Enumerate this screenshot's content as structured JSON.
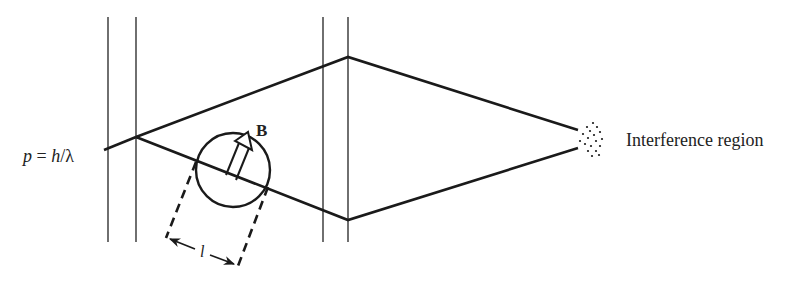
{
  "diagram": {
    "type": "aharonov-bohm-interference",
    "labels": {
      "momentum": "p = h/λ",
      "momentum_p": "p",
      "momentum_eq": " = ",
      "momentum_h": "h",
      "momentum_slash": "/λ",
      "field": "B",
      "length": "l",
      "region": "Interference region"
    },
    "colors": {
      "line": "#1a1a1a",
      "thin_line": "#333333",
      "text": "#222222",
      "background": "#ffffff"
    }
  }
}
